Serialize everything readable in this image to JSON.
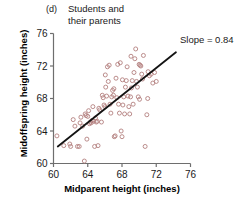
{
  "figure": {
    "panel_label": "(d)",
    "title": "Students and their parents",
    "title_line1": "Students and",
    "title_line2": "their parents"
  },
  "chart_data": {
    "type": "scatter",
    "title": "Students and their parents",
    "panel": "(d)",
    "xlabel": "Midparent height (inches)",
    "ylabel": "Midoffspring height (inches)",
    "xlim": [
      60,
      76
    ],
    "ylim": [
      60,
      76
    ],
    "xticks": [
      60,
      64,
      68,
      72,
      76
    ],
    "yticks": [
      60,
      64,
      68,
      72,
      76
    ],
    "xtick_labels": [
      "60",
      "64",
      "68",
      "72",
      "76"
    ],
    "ytick_labels": [
      "60",
      "64",
      "68",
      "72",
      "76"
    ],
    "grid": false,
    "legend": null,
    "marker": "open-circle",
    "marker_color": "#b3807f",
    "annotations": [
      {
        "name": "slope-annotation",
        "text": "Slope = 0.84",
        "x": 74.6,
        "y": 74.4
      }
    ],
    "fit_line": {
      "name": "regression-line",
      "slope": 0.84,
      "label": "Slope = 0.84",
      "color": "#141414",
      "x_start": 60.5,
      "y_start": 62.1,
      "x_end": 74.3,
      "y_end": 73.7
    },
    "x": [
      60.4,
      61.2,
      61.9,
      62.0,
      62.3,
      62.8,
      63.0,
      63.2,
      63.4,
      63.6,
      63.7,
      63.8,
      63.9,
      64.0,
      64.1,
      64.2,
      64.3,
      64.4,
      64.5,
      64.6,
      64.7,
      64.8,
      65.0,
      65.1,
      65.2,
      65.4,
      65.6,
      65.7,
      65.8,
      65.9,
      66.0,
      66.1,
      66.2,
      66.3,
      66.4,
      66.5,
      66.6,
      66.7,
      66.8,
      66.9,
      67.0,
      67.1,
      67.2,
      67.3,
      67.4,
      67.5,
      67.6,
      67.7,
      67.8,
      67.9,
      68.0,
      68.1,
      68.2,
      68.3,
      68.4,
      68.5,
      68.6,
      68.7,
      68.8,
      68.9,
      69.0,
      69.1,
      69.2,
      69.3,
      69.4,
      69.5,
      69.6,
      69.7,
      69.8,
      69.9,
      70.0,
      70.1,
      70.2,
      70.3,
      70.4,
      70.5,
      70.7,
      70.9,
      71.0,
      71.2,
      71.4,
      71.6,
      71.8,
      72.0,
      62.5,
      63.1,
      64.9,
      65.3,
      66.05,
      67.05,
      68.05,
      69.05,
      70.05,
      71.05
    ],
    "y": [
      63.4,
      62.2,
      62.4,
      62.1,
      65.4,
      62.1,
      62.1,
      65.7,
      64.6,
      60.3,
      66.1,
      65.9,
      63.0,
      65.8,
      66.5,
      64.9,
      65.1,
      65.0,
      65.3,
      67.0,
      65.2,
      62.1,
      65.1,
      65.2,
      62.2,
      66.6,
      65.1,
      68.4,
      68.1,
      67.2,
      67.0,
      69.4,
      68.3,
      71.9,
      70.1,
      72.1,
      67.3,
      66.2,
      68.2,
      69.0,
      68.4,
      63.3,
      63.4,
      70.5,
      68.1,
      72.2,
      67.3,
      66.2,
      72.4,
      64.0,
      63.3,
      67.2,
      68.2,
      66.1,
      69.4,
      70.2,
      71.9,
      68.3,
      67.0,
      66.1,
      68.2,
      69.3,
      70.2,
      67.3,
      71.2,
      72.9,
      74.1,
      70.1,
      69.4,
      68.2,
      72.2,
      72.1,
      72.0,
      71.0,
      70.4,
      73.3,
      62.1,
      66.0,
      68.0,
      70.8,
      71.0,
      69.9,
      71.2,
      70.1,
      64.6,
      65.0,
      65.6,
      66.8,
      70.9,
      69.2,
      70.3,
      73.2,
      67.9,
      71.3
    ]
  }
}
